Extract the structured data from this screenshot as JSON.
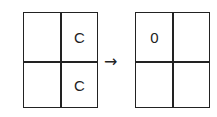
{
  "diagram": {
    "before": {
      "cells": [
        [
          "",
          "C"
        ],
        [
          "",
          "C"
        ]
      ]
    },
    "arrow": "→",
    "after": {
      "cells": [
        [
          "0",
          ""
        ],
        [
          "",
          ""
        ]
      ]
    }
  }
}
